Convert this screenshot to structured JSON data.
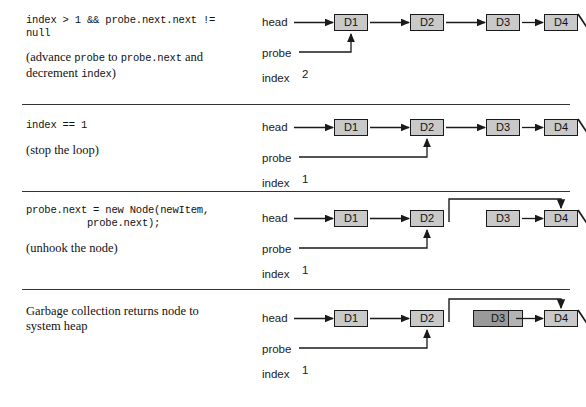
{
  "figure": {
    "kind": "linked-list-insertion-trace",
    "colors": {
      "node_fill": "#c9c9c9",
      "node_fill_dead": "#9a9a9a",
      "stroke": "#1a1a1a",
      "divider": "#333333",
      "background": "#ffffff"
    },
    "rows": [
      {
        "id": "row-1",
        "text": {
          "code_lines": [
            "index > 1 && probe.next.next !=",
            "null"
          ],
          "prose_parts": [
            {
              "type": "text",
              "value": "(advance "
            },
            {
              "type": "mono",
              "value": "probe"
            },
            {
              "type": "text",
              "value": " to "
            },
            {
              "type": "mono",
              "value": "probe.next"
            },
            {
              "type": "text",
              "value": " and"
            }
          ],
          "prose_line2_parts": [
            {
              "type": "text",
              "value": "decrement "
            },
            {
              "type": "mono",
              "value": "index"
            },
            {
              "type": "text",
              "value": ")"
            }
          ]
        },
        "diagram": {
          "head_label": "head",
          "probe_label": "probe",
          "index_label": "index",
          "index_value": "2",
          "nodes": [
            {
              "label": "D1",
              "state": "normal"
            },
            {
              "label": "D2",
              "state": "normal"
            },
            {
              "label": "D3",
              "state": "normal"
            },
            {
              "label": "D4",
              "state": "normal"
            }
          ],
          "probe_target": "D1",
          "bypass_arrow": false,
          "null_terminator": true
        }
      },
      {
        "id": "row-2",
        "text": {
          "code_lines": [
            "index == 1"
          ],
          "prose_parts": [
            {
              "type": "text",
              "value": "(stop the loop)"
            }
          ],
          "prose_line2_parts": []
        },
        "diagram": {
          "head_label": "head",
          "probe_label": "probe",
          "index_label": "index",
          "index_value": "1",
          "nodes": [
            {
              "label": "D1",
              "state": "normal"
            },
            {
              "label": "D2",
              "state": "normal"
            },
            {
              "label": "D3",
              "state": "normal"
            },
            {
              "label": "D4",
              "state": "normal"
            }
          ],
          "probe_target": "D2",
          "bypass_arrow": false,
          "null_terminator": true
        }
      },
      {
        "id": "row-3",
        "text": {
          "code_lines": [
            "probe.next = new Node(newItem,",
            "          probe.next);"
          ],
          "prose_parts": [
            {
              "type": "text",
              "value": "(unhook the node)"
            }
          ],
          "prose_line2_parts": []
        },
        "diagram": {
          "head_label": "head",
          "probe_label": "probe",
          "index_label": "index",
          "index_value": "1",
          "nodes": [
            {
              "label": "D1",
              "state": "normal"
            },
            {
              "label": "D2",
              "state": "normal"
            },
            {
              "label": "D3",
              "state": "normal"
            },
            {
              "label": "D4",
              "state": "normal"
            }
          ],
          "probe_target": "D2",
          "bypass_arrow": true,
          "null_terminator": true
        }
      },
      {
        "id": "row-4",
        "text": {
          "code_lines": [],
          "prose_parts": [
            {
              "type": "text",
              "value": "Garbage collection returns node to"
            }
          ],
          "prose_line2_parts": [
            {
              "type": "text",
              "value": "system heap"
            }
          ]
        },
        "diagram": {
          "head_label": "head",
          "probe_label": "probe",
          "index_label": "index",
          "index_value": "1",
          "nodes": [
            {
              "label": "D1",
              "state": "normal"
            },
            {
              "label": "D2",
              "state": "normal"
            },
            {
              "label": "D3",
              "state": "dead"
            },
            {
              "label": "D4",
              "state": "normal"
            }
          ],
          "probe_target": "D2",
          "bypass_arrow": true,
          "null_terminator": true
        }
      }
    ]
  }
}
